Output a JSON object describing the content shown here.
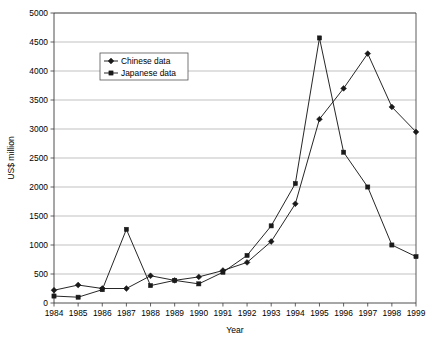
{
  "chart_data": {
    "type": "line",
    "title": "",
    "xlabel": "Year",
    "ylabel": "US$ million",
    "x": [
      1984,
      1985,
      1986,
      1987,
      1988,
      1989,
      1990,
      1991,
      1992,
      1993,
      1994,
      1995,
      1996,
      1997,
      1998,
      1999
    ],
    "categories": [
      "1984",
      "1985",
      "1986",
      "1987",
      "1988",
      "1989",
      "1990",
      "1991",
      "1992",
      "1993",
      "1994",
      "1995",
      "1996",
      "1997",
      "1998",
      "1999"
    ],
    "xlim": [
      1984,
      1999
    ],
    "ylim": [
      0,
      5000
    ],
    "yticks": [
      0,
      500,
      1000,
      1500,
      2000,
      2500,
      3000,
      3500,
      4000,
      4500,
      5000
    ],
    "ytick_labels": [
      "0",
      "500",
      "1000",
      "1500",
      "2000",
      "2500",
      "3000",
      "3500",
      "4000",
      "4500",
      "5000"
    ],
    "grid": true,
    "grid_axis": "y",
    "legend_position": "upper-left-inset",
    "series": [
      {
        "name": "Chinese data",
        "marker": "diamond",
        "color": "#1a1a1a",
        "values": [
          220,
          310,
          250,
          250,
          470,
          390,
          450,
          560,
          700,
          1060,
          1710,
          3170,
          3700,
          4300,
          3380,
          2950
        ]
      },
      {
        "name": "Japanese data",
        "marker": "square",
        "color": "#1a1a1a",
        "values": [
          120,
          100,
          230,
          1270,
          300,
          390,
          330,
          530,
          820,
          1330,
          2060,
          4570,
          2600,
          2000,
          1000,
          800
        ]
      }
    ],
    "legend": [
      "Chinese data",
      "Japanese data"
    ]
  },
  "geometry": {
    "plot_left": 54,
    "plot_right": 416,
    "plot_top": 13,
    "plot_bottom": 303,
    "legend_x": 100,
    "legend_y": 53,
    "legend_w": 88,
    "legend_h": 27
  }
}
